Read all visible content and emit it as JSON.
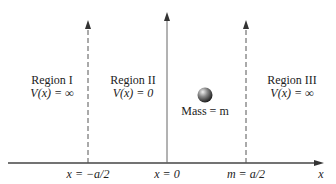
{
  "diagram": {
    "regions": [
      {
        "name": "Region I",
        "potential": "V(x) = ∞"
      },
      {
        "name": "Region II",
        "potential": "V(x) = 0"
      },
      {
        "name": "Region III",
        "potential": "V(x) = ∞"
      }
    ],
    "mass_label": "Mass = m",
    "axis_labels": {
      "left_wall": "x = −a/2",
      "center": "x = 0",
      "right_wall": "m = a/2",
      "x_axis": "x"
    },
    "colors": {
      "lines": "#444444",
      "mass_ball": "#777777"
    }
  }
}
